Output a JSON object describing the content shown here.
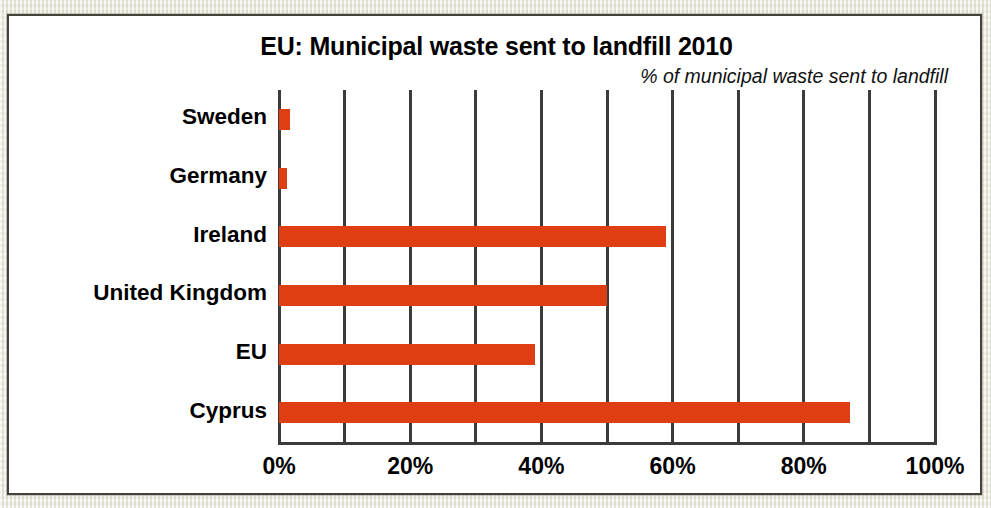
{
  "chart_data": {
    "type": "bar",
    "orientation": "horizontal",
    "title": "EU: Municipal waste sent to landfill 2010",
    "subtitle": "% of municipal waste sent to landfill",
    "xlabel": "",
    "ylabel": "",
    "xlim": [
      0,
      100
    ],
    "xtick_values": [
      0,
      10,
      20,
      30,
      40,
      50,
      60,
      70,
      80,
      90,
      100
    ],
    "xtick_labels": [
      "0%",
      "",
      "20%",
      "",
      "40%",
      "",
      "60%",
      "",
      "80%",
      "",
      "100%"
    ],
    "labeled_ticks": [
      {
        "value": 0,
        "label": "0%"
      },
      {
        "value": 20,
        "label": "20%"
      },
      {
        "value": 40,
        "label": "40%"
      },
      {
        "value": 60,
        "label": "60%"
      },
      {
        "value": 80,
        "label": "80%"
      },
      {
        "value": 100,
        "label": "100%"
      }
    ],
    "grid": true,
    "grid_axis": "x",
    "legend": false,
    "bar_color": "#df3d12",
    "categories": [
      "Sweden",
      "Germany",
      "Ireland",
      "United Kingdom",
      "EU",
      "Cyprus"
    ],
    "values": [
      1.7,
      1.2,
      59,
      50,
      39,
      87
    ],
    "series": [
      {
        "name": "% of municipal waste sent to landfill",
        "color": "#df3d12",
        "values": [
          1.7,
          1.2,
          59,
          50,
          39,
          87
        ]
      }
    ],
    "bars": [
      {
        "category": "Sweden",
        "value": 1.7
      },
      {
        "category": "Germany",
        "value": 1.2
      },
      {
        "category": "Ireland",
        "value": 59
      },
      {
        "category": "United Kingdom",
        "value": 50
      },
      {
        "category": "EU",
        "value": 39
      },
      {
        "category": "Cyprus",
        "value": 87
      }
    ]
  },
  "colors": {
    "bar": "#df3d12",
    "axis": "#3b3b3b",
    "panel_background": "#ffffff",
    "page_background": "#edebdf",
    "border": "#45423c",
    "text": "#000000"
  },
  "panel": {
    "title": "EU: Municipal waste sent to landfill 2010",
    "subtitle": "% of municipal waste sent to landfill"
  },
  "axis": {
    "tick_0": "0%",
    "tick_20": "20%",
    "tick_40": "40%",
    "tick_60": "60%",
    "tick_80": "80%",
    "tick_100": "100%"
  },
  "categories": {
    "c0": "Sweden",
    "c1": "Germany",
    "c2": "Ireland",
    "c3": "United Kingdom",
    "c4": "EU",
    "c5": "Cyprus"
  }
}
